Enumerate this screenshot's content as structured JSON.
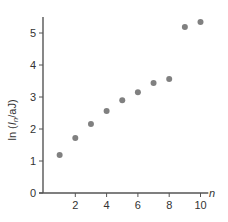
{
  "chart_data": {
    "type": "scatter",
    "title": "",
    "xlabel": "n",
    "ylabel": "ln (I_n/aJ)",
    "ylabel_parts": {
      "prefix": "ln (",
      "var": "I",
      "sub": "n",
      "suffix": "/aJ)"
    },
    "xlim": [
      0,
      10.5
    ],
    "ylim": [
      0,
      5.5
    ],
    "x_ticks": [
      2,
      4,
      6,
      8,
      10
    ],
    "y_ticks": [
      0,
      1,
      2,
      3,
      4,
      5
    ],
    "grid": false,
    "legend": null,
    "point_color": "#808080",
    "x": [
      1,
      2,
      3,
      4,
      5,
      6,
      7,
      8,
      9,
      10
    ],
    "y": [
      1.19,
      1.72,
      2.16,
      2.56,
      2.9,
      3.15,
      3.44,
      3.56,
      5.19,
      5.34
    ]
  }
}
